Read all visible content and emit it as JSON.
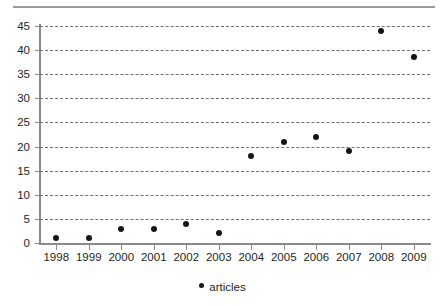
{
  "chart_data": {
    "type": "scatter",
    "title": "",
    "subtitle": "",
    "xlabel": "",
    "ylabel": "",
    "categories": [
      "1998",
      "1999",
      "2000",
      "2001",
      "2002",
      "2003",
      "2004",
      "2005",
      "2006",
      "2007",
      "2008",
      "2009"
    ],
    "series": [
      {
        "name": "articles",
        "values": [
          1,
          1,
          3,
          3,
          4,
          2,
          18,
          21,
          22,
          19,
          44,
          38.5
        ]
      }
    ],
    "x": [
      1998,
      1999,
      2000,
      2001,
      2002,
      2003,
      2004,
      2005,
      2006,
      2007,
      2008,
      2009
    ],
    "ylim": [
      0,
      45
    ],
    "ytick_labels": [
      "0",
      "5",
      "10",
      "15",
      "20",
      "25",
      "30",
      "35",
      "40",
      "45"
    ],
    "ytick_values": [
      0,
      5,
      10,
      15,
      20,
      25,
      30,
      35,
      40,
      45
    ],
    "grid": "horizontal-dashed",
    "legend_position": "bottom-center",
    "legend_entries": [
      "articles"
    ],
    "marker": "filled-circle",
    "marker_color": "#161616",
    "gridline_color": "#6e6e6e",
    "axis_color": "#8a8a8a",
    "background_color": "#ffffff",
    "top_rule_color": "#9b9b9b"
  }
}
